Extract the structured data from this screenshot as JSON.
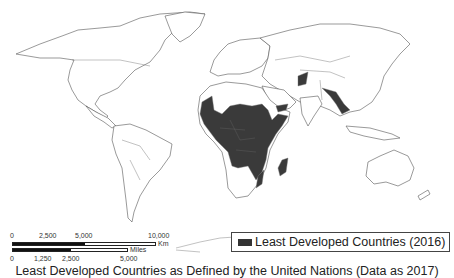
{
  "map": {
    "type": "choropleth world map",
    "highlight_color": "#3a3a3a",
    "highlighted_regions": [
      "Sub-Saharan Africa (most countries)",
      "Afghanistan",
      "Yemen",
      "Nepal",
      "Bangladesh",
      "Myanmar",
      "Laos",
      "Cambodia",
      "Madagascar",
      "Mozambique"
    ]
  },
  "scale_bar": {
    "km_ticks": [
      "0",
      "2,500",
      "5,000",
      "10,000"
    ],
    "km_unit": "Km",
    "mile_ticks": [
      "0",
      "1,250",
      "2,500",
      "5,000"
    ],
    "mile_unit": "Miles"
  },
  "legend": {
    "label": "Least Developed Countries (2016)",
    "swatch_color": "#333333"
  },
  "caption": "Least Developed Countries as Defined by the United Nations (Data as 2017)"
}
